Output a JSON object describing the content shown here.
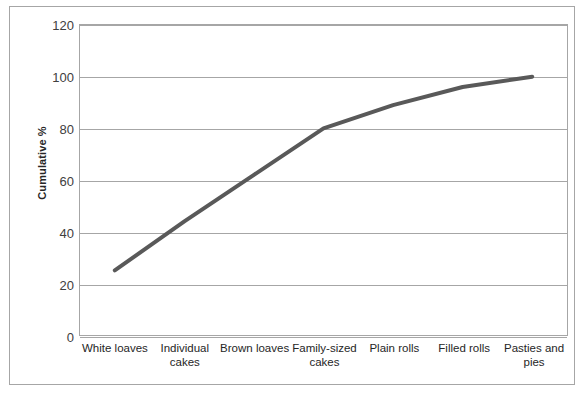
{
  "chart_data": {
    "type": "line",
    "title": "",
    "xlabel": "",
    "ylabel": "Cumulative %",
    "categories": [
      "White loaves",
      "Individual cakes",
      "Brown loaves",
      "Family-sized cakes",
      "Plain rolls",
      "Filled rolls",
      "Pasties and pies"
    ],
    "values": [
      25,
      44,
      62,
      80,
      89,
      96,
      100
    ],
    "ylim": [
      0,
      120
    ],
    "yticks": [
      0,
      20,
      40,
      60,
      80,
      100,
      120
    ],
    "ytick_labels": [
      "0",
      "20",
      "40",
      "60",
      "80",
      "100",
      "120"
    ],
    "grid": "horizontal",
    "legend": "none",
    "series": [
      {
        "name": "Cumulative %",
        "values": [
          25,
          44,
          62,
          80,
          89,
          96,
          100
        ],
        "color": "#595959",
        "line_width": 4
      }
    ]
  },
  "axes": {
    "y_title": "Cumulative %",
    "y_ticks": [
      "0",
      "20",
      "40",
      "60",
      "80",
      "100",
      "120"
    ],
    "x_ticks": [
      "White loaves",
      "Individual cakes",
      "Brown loaves",
      "Family-sized cakes",
      "Plain rolls",
      "Filled rolls",
      "Pasties and pies"
    ]
  },
  "colors": {
    "series_line": "#595959",
    "gridline": "#a6a6a6",
    "axis": "#a6a6a6",
    "frame": "#a6a6a6",
    "tick_text": "#404040",
    "background": "#ffffff"
  }
}
